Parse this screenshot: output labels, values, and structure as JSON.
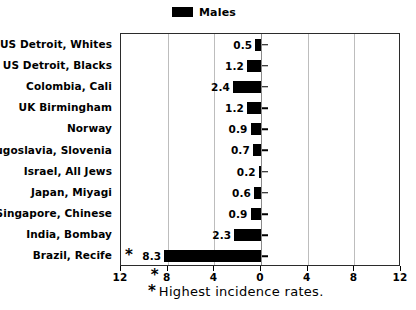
{
  "chart_data": {
    "type": "bar",
    "orientation": "horizontal-left",
    "title": "",
    "xlabel": "",
    "ylabel": "",
    "categories": [
      "US Detroit, Whites",
      "US Detroit, Blacks",
      "Colombia, Cali",
      "UK Birmingham",
      "Norway",
      "Yugoslavia, Slovenia",
      "Israel, All Jews",
      "Japan, Miyagi",
      "Singapore, Chinese",
      "India, Bombay",
      "Brazil, Recife"
    ],
    "series": [
      {
        "name": "Males",
        "color": "#000000",
        "values": [
          0.5,
          1.2,
          2.4,
          1.2,
          0.9,
          0.7,
          0.2,
          0.6,
          0.9,
          2.3,
          8.3
        ]
      }
    ],
    "value_labels": [
      "0.5",
      "1.2",
      "2.4",
      "1.2",
      "0.9",
      "0.7",
      "0.2",
      "0.6",
      "0.9",
      "2.3",
      "8.3"
    ],
    "starred_categories": [
      "Brazil, Recife"
    ],
    "xlim": [
      12,
      -12
    ],
    "xticks": [
      12,
      8,
      4,
      0,
      4,
      8,
      12
    ],
    "xtick_labels": [
      "12",
      "8",
      "4",
      "0",
      "4",
      "8",
      "12"
    ],
    "gridlines": [
      8,
      4,
      0,
      -4,
      -8
    ],
    "grid": true,
    "legend": {
      "position": "top-center",
      "entries": [
        {
          "label": "Males",
          "color": "#000000"
        }
      ]
    },
    "annotations": [
      {
        "symbol": "*",
        "text": "Highest incidence rates."
      }
    ]
  },
  "legend": {
    "label": "Males"
  },
  "caption": {
    "star": "*",
    "text": "Highest incidence rates."
  },
  "axis": {
    "star": "*"
  }
}
